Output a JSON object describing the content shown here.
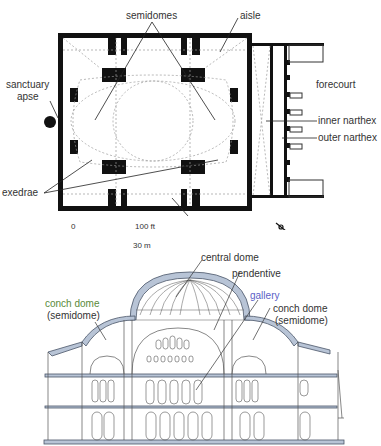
{
  "plan": {
    "labels": {
      "semidomes": "semidomes",
      "aisle": "aisle",
      "sanctuary_apse_1": "sanctuary",
      "sanctuary_apse_2": "apse",
      "forecourt": "forecourt",
      "inner_narthex": "inner narthex",
      "outer_narthex": "outer narthex",
      "exedrae": "exedrae"
    },
    "scale": {
      "zero": "0",
      "feet": "100 ft",
      "meters": "30 m"
    },
    "compass": "north-arrow"
  },
  "section": {
    "labels": {
      "central_dome": "central dome",
      "pendentive": "pendentive",
      "gallery": "gallery",
      "conch_left_1": "conch dome",
      "conch_left_2": "(semidome)",
      "conch_right_1": "conch dome",
      "conch_right_2": "(semidome)"
    },
    "colors": {
      "section_fill": "#b8c4d6",
      "line": "#555555",
      "gallery_label": "#5b5fc7",
      "conch_left_label": "#5a8a3a"
    }
  }
}
